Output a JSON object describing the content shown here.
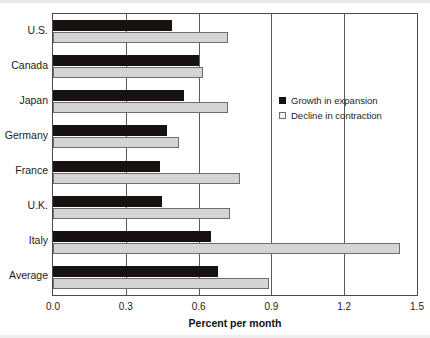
{
  "chart_data": {
    "type": "bar",
    "orientation": "horizontal",
    "title": "",
    "xlabel": "Percent per month",
    "ylabel": "",
    "xlim": [
      0.0,
      1.5
    ],
    "xticks": [
      "0.0",
      "0.3",
      "0.6",
      "0.9",
      "1.2",
      "1.5"
    ],
    "xtick_values": [
      0.0,
      0.3,
      0.6,
      0.9,
      1.2,
      1.5
    ],
    "grid": true,
    "grid_axis": "x",
    "legend_position": "center-right-inside",
    "categories": [
      "U.S.",
      "Canada",
      "Japan",
      "Germany",
      "France",
      "U.K.",
      "Italy",
      "Average"
    ],
    "series": [
      {
        "name": "Growth in expansion",
        "color": "#17120f",
        "values": [
          0.49,
          0.6,
          0.54,
          0.47,
          0.44,
          0.45,
          0.65,
          0.68
        ]
      },
      {
        "name": "Decline in contraction",
        "color": "#d4d4d4",
        "values": [
          0.72,
          0.62,
          0.72,
          0.52,
          0.77,
          0.73,
          1.43,
          0.89
        ]
      }
    ]
  },
  "legend": {
    "items": [
      {
        "label": "Growth in expansion",
        "swatch": "dark"
      },
      {
        "label": "Decline in contraction",
        "swatch": "light"
      }
    ]
  },
  "axis": {
    "x_title": "Percent per month"
  }
}
